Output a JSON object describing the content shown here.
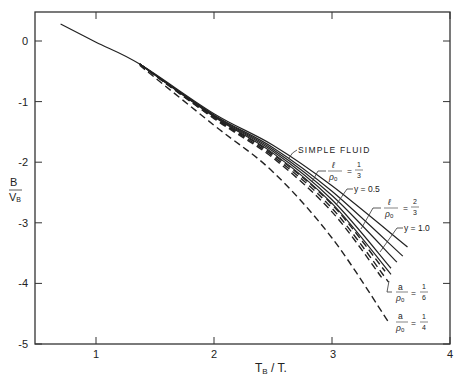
{
  "chart_data": {
    "type": "line",
    "title": "",
    "xlabel": "T_B / T.",
    "ylabel": "B / V_B",
    "xlim": [
      0.48,
      4
    ],
    "ylim": [
      -5,
      0.48
    ],
    "xticks": [
      1,
      2,
      3,
      4
    ],
    "yticks": [
      0,
      -1,
      -2,
      -3,
      -4,
      -5
    ],
    "grid": false,
    "series": [
      {
        "name": "SIMPLE FLUID",
        "style": "solid",
        "x": [
          0.7,
          1.0,
          1.37,
          2.0,
          2.5,
          3.0,
          3.64
        ],
        "y": [
          0.28,
          -0.02,
          -0.38,
          -1.2,
          -1.72,
          -2.39,
          -3.4
        ]
      },
      {
        "name": "l/ρ0 = 1/3",
        "style": "solid",
        "x": [
          1.37,
          2.0,
          2.5,
          3.0,
          3.6
        ],
        "y": [
          -0.38,
          -1.22,
          -1.76,
          -2.48,
          -3.55
        ]
      },
      {
        "name": "y = 0.5",
        "style": "solid",
        "x": [
          1.37,
          2.0,
          2.5,
          3.0,
          3.55
        ],
        "y": [
          -0.38,
          -1.23,
          -1.79,
          -2.55,
          -3.65
        ]
      },
      {
        "name": "l/ρ0 = 2/3",
        "style": "solid",
        "x": [
          1.37,
          2.0,
          2.5,
          3.0,
          3.5
        ],
        "y": [
          -0.38,
          -1.24,
          -1.82,
          -2.62,
          -3.75
        ]
      },
      {
        "name": "y = 1.0",
        "style": "solid",
        "x": [
          1.37,
          2.0,
          2.5,
          3.0,
          3.5
        ],
        "y": [
          -0.38,
          -1.25,
          -1.85,
          -2.68,
          -3.85
        ]
      },
      {
        "name": "a/ρ0 = 1/6",
        "style": "dashed",
        "x": [
          1.37,
          2.0,
          2.5,
          3.0,
          3.48
        ],
        "y": [
          -0.38,
          -1.27,
          -1.9,
          -2.76,
          -3.98
        ]
      },
      {
        "name": "dashed-intermediate-1",
        "style": "dashed",
        "x": [
          1.37,
          2.0,
          2.5,
          3.0,
          3.45
        ],
        "y": [
          -0.38,
          -1.26,
          -1.87,
          -2.7,
          -3.8
        ]
      },
      {
        "name": "dashed-intermediate-2",
        "style": "dashed",
        "x": [
          1.37,
          2.0,
          2.5,
          3.0,
          3.42
        ],
        "y": [
          -0.38,
          -1.28,
          -1.93,
          -2.82,
          -3.9
        ]
      },
      {
        "name": "a/ρ0 = 1/4",
        "style": "dashed",
        "x": [
          1.37,
          2.0,
          2.5,
          3.0,
          3.48
        ],
        "y": [
          -0.4,
          -1.39,
          -2.16,
          -3.25,
          -4.64
        ]
      }
    ],
    "annotations": [
      {
        "text": "SIMPLE FLUID",
        "x": 2.95,
        "y": -1.78
      },
      {
        "text": "l/ρ0 = 1/3",
        "x": 3.25,
        "y": -2.45
      },
      {
        "text": "y = 0.5",
        "x": 3.1,
        "y": -2.9
      },
      {
        "text": "l/ρ0 = 2/3",
        "x": 3.55,
        "y": -3.0
      },
      {
        "text": "y = 1.0",
        "x": 3.55,
        "y": -3.35
      },
      {
        "text": "a/ρ0 = 1/6",
        "x": 3.5,
        "y": -4.05
      },
      {
        "text": "a/ρ0 = 1/4",
        "x": 3.5,
        "y": -4.65
      }
    ]
  },
  "axes": {
    "xlabel_main": "T",
    "xlabel_sub": "B",
    "xlabel_rest": " / T.",
    "ylabel_num": "B",
    "ylabel_den": "V",
    "ylabel_den_sub": "B",
    "xtick_labels": [
      "1",
      "2",
      "3",
      "4"
    ],
    "ytick_labels": [
      "0",
      "-1",
      "-2",
      "-3",
      "-4",
      "-5"
    ]
  },
  "labels": {
    "simple_fluid": "SIMPLE FLUID",
    "l_sym": "ℓ",
    "a_sym": "a",
    "rho": "ρ",
    "rho_sub": "0",
    "eq": "=",
    "one": "1",
    "two": "2",
    "three": "3",
    "four": "4",
    "six": "6",
    "y05": "y = 0.5",
    "y10": "y = 1.0"
  }
}
